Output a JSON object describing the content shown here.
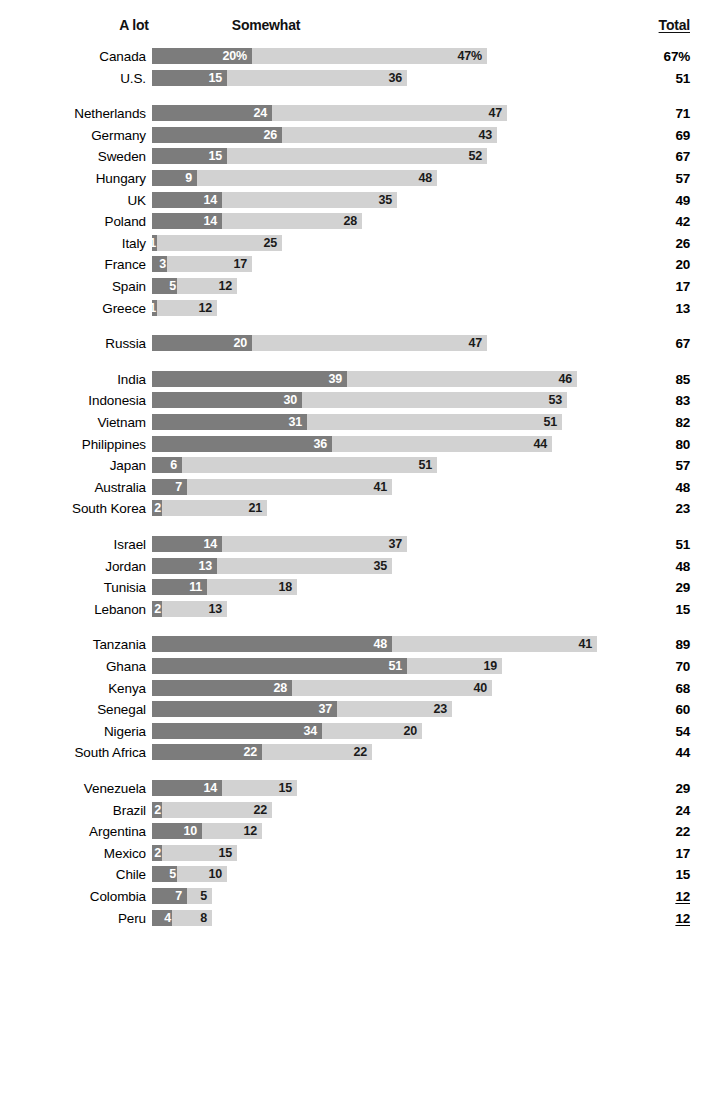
{
  "header": {
    "col_alot": "A lot",
    "col_somewhat": "Somewhat",
    "col_total": "Total"
  },
  "chart_data": {
    "type": "bar",
    "subtype": "stacked-horizontal",
    "title": "",
    "xlabel": "",
    "ylabel": "",
    "legend": [
      "A lot",
      "Somewhat"
    ],
    "legend_position": "top",
    "grid": false,
    "xlim": [
      0,
      100
    ],
    "colors": {
      "a_lot": "#7c7c7c",
      "somewhat": "#d2d2d2"
    },
    "series": [
      {
        "name": "A lot",
        "color": "#7c7c7c"
      },
      {
        "name": "Somewhat",
        "color": "#d2d2d2"
      }
    ],
    "categories": [
      "Canada",
      "U.S.",
      "Netherlands",
      "Germany",
      "Sweden",
      "Hungary",
      "UK",
      "Poland",
      "Italy",
      "France",
      "Spain",
      "Greece",
      "Russia",
      "India",
      "Indonesia",
      "Vietnam",
      "Philippines",
      "Japan",
      "Australia",
      "South Korea",
      "Israel",
      "Jordan",
      "Tunisia",
      "Lebanon",
      "Tanzania",
      "Ghana",
      "Kenya",
      "Senegal",
      "Nigeria",
      "South Africa",
      "Venezuela",
      "Brazil",
      "Argentina",
      "Mexico",
      "Chile",
      "Colombia",
      "Peru"
    ],
    "groups": [
      {
        "rows": [
          {
            "label": "Canada",
            "a_lot": 20,
            "somewhat": 47,
            "total": 67,
            "a_lot_text": "20%",
            "somewhat_text": "47%",
            "total_text": "67%"
          },
          {
            "label": "U.S.",
            "a_lot": 15,
            "somewhat": 36,
            "total": 51,
            "a_lot_text": "15",
            "somewhat_text": "36",
            "total_text": "51"
          }
        ]
      },
      {
        "rows": [
          {
            "label": "Netherlands",
            "a_lot": 24,
            "somewhat": 47,
            "total": 71,
            "a_lot_text": "24",
            "somewhat_text": "47",
            "total_text": "71"
          },
          {
            "label": "Germany",
            "a_lot": 26,
            "somewhat": 43,
            "total": 69,
            "a_lot_text": "26",
            "somewhat_text": "43",
            "total_text": "69"
          },
          {
            "label": "Sweden",
            "a_lot": 15,
            "somewhat": 52,
            "total": 67,
            "a_lot_text": "15",
            "somewhat_text": "52",
            "total_text": "67"
          },
          {
            "label": "Hungary",
            "a_lot": 9,
            "somewhat": 48,
            "total": 57,
            "a_lot_text": "9",
            "somewhat_text": "48",
            "total_text": "57"
          },
          {
            "label": "UK",
            "a_lot": 14,
            "somewhat": 35,
            "total": 49,
            "a_lot_text": "14",
            "somewhat_text": "35",
            "total_text": "49"
          },
          {
            "label": "Poland",
            "a_lot": 14,
            "somewhat": 28,
            "total": 42,
            "a_lot_text": "14",
            "somewhat_text": "28",
            "total_text": "42"
          },
          {
            "label": "Italy",
            "a_lot": 1,
            "somewhat": 25,
            "total": 26,
            "a_lot_text": "1",
            "somewhat_text": "25",
            "total_text": "26"
          },
          {
            "label": "France",
            "a_lot": 3,
            "somewhat": 17,
            "total": 20,
            "a_lot_text": "3",
            "somewhat_text": "17",
            "total_text": "20"
          },
          {
            "label": "Spain",
            "a_lot": 5,
            "somewhat": 12,
            "total": 17,
            "a_lot_text": "5",
            "somewhat_text": "12",
            "total_text": "17"
          },
          {
            "label": "Greece",
            "a_lot": 1,
            "somewhat": 12,
            "total": 13,
            "a_lot_text": "1",
            "somewhat_text": "12",
            "total_text": "13"
          }
        ]
      },
      {
        "rows": [
          {
            "label": "Russia",
            "a_lot": 20,
            "somewhat": 47,
            "total": 67,
            "a_lot_text": "20",
            "somewhat_text": "47",
            "total_text": "67"
          }
        ]
      },
      {
        "rows": [
          {
            "label": "India",
            "a_lot": 39,
            "somewhat": 46,
            "total": 85,
            "a_lot_text": "39",
            "somewhat_text": "46",
            "total_text": "85"
          },
          {
            "label": "Indonesia",
            "a_lot": 30,
            "somewhat": 53,
            "total": 83,
            "a_lot_text": "30",
            "somewhat_text": "53",
            "total_text": "83"
          },
          {
            "label": "Vietnam",
            "a_lot": 31,
            "somewhat": 51,
            "total": 82,
            "a_lot_text": "31",
            "somewhat_text": "51",
            "total_text": "82"
          },
          {
            "label": "Philippines",
            "a_lot": 36,
            "somewhat": 44,
            "total": 80,
            "a_lot_text": "36",
            "somewhat_text": "44",
            "total_text": "80"
          },
          {
            "label": "Japan",
            "a_lot": 6,
            "somewhat": 51,
            "total": 57,
            "a_lot_text": "6",
            "somewhat_text": "51",
            "total_text": "57"
          },
          {
            "label": "Australia",
            "a_lot": 7,
            "somewhat": 41,
            "total": 48,
            "a_lot_text": "7",
            "somewhat_text": "41",
            "total_text": "48"
          },
          {
            "label": "South Korea",
            "a_lot": 2,
            "somewhat": 21,
            "total": 23,
            "a_lot_text": "2",
            "somewhat_text": "21",
            "total_text": "23"
          }
        ]
      },
      {
        "rows": [
          {
            "label": "Israel",
            "a_lot": 14,
            "somewhat": 37,
            "total": 51,
            "a_lot_text": "14",
            "somewhat_text": "37",
            "total_text": "51"
          },
          {
            "label": "Jordan",
            "a_lot": 13,
            "somewhat": 35,
            "total": 48,
            "a_lot_text": "13",
            "somewhat_text": "35",
            "total_text": "48"
          },
          {
            "label": "Tunisia",
            "a_lot": 11,
            "somewhat": 18,
            "total": 29,
            "a_lot_text": "11",
            "somewhat_text": "18",
            "total_text": "29"
          },
          {
            "label": "Lebanon",
            "a_lot": 2,
            "somewhat": 13,
            "total": 15,
            "a_lot_text": "2",
            "somewhat_text": "13",
            "total_text": "15"
          }
        ]
      },
      {
        "rows": [
          {
            "label": "Tanzania",
            "a_lot": 48,
            "somewhat": 41,
            "total": 89,
            "a_lot_text": "48",
            "somewhat_text": "41",
            "total_text": "89"
          },
          {
            "label": "Ghana",
            "a_lot": 51,
            "somewhat": 19,
            "total": 70,
            "a_lot_text": "51",
            "somewhat_text": "19",
            "total_text": "70"
          },
          {
            "label": "Kenya",
            "a_lot": 28,
            "somewhat": 40,
            "total": 68,
            "a_lot_text": "28",
            "somewhat_text": "40",
            "total_text": "68"
          },
          {
            "label": "Senegal",
            "a_lot": 37,
            "somewhat": 23,
            "total": 60,
            "a_lot_text": "37",
            "somewhat_text": "23",
            "total_text": "60"
          },
          {
            "label": "Nigeria",
            "a_lot": 34,
            "somewhat": 20,
            "total": 54,
            "a_lot_text": "34",
            "somewhat_text": "20",
            "total_text": "54"
          },
          {
            "label": "South Africa",
            "a_lot": 22,
            "somewhat": 22,
            "total": 44,
            "a_lot_text": "22",
            "somewhat_text": "22",
            "total_text": "44"
          }
        ]
      },
      {
        "rows": [
          {
            "label": "Venezuela",
            "a_lot": 14,
            "somewhat": 15,
            "total": 29,
            "a_lot_text": "14",
            "somewhat_text": "15",
            "total_text": "29"
          },
          {
            "label": "Brazil",
            "a_lot": 2,
            "somewhat": 22,
            "total": 24,
            "a_lot_text": "2",
            "somewhat_text": "22",
            "total_text": "24"
          },
          {
            "label": "Argentina",
            "a_lot": 10,
            "somewhat": 12,
            "total": 22,
            "a_lot_text": "10",
            "somewhat_text": "12",
            "total_text": "22"
          },
          {
            "label": "Mexico",
            "a_lot": 2,
            "somewhat": 15,
            "total": 17,
            "a_lot_text": "2",
            "somewhat_text": "15",
            "total_text": "17"
          },
          {
            "label": "Chile",
            "a_lot": 5,
            "somewhat": 10,
            "total": 15,
            "a_lot_text": "5",
            "somewhat_text": "10",
            "total_text": "15"
          },
          {
            "label": "Colombia",
            "a_lot": 7,
            "somewhat": 5,
            "total": 12,
            "a_lot_text": "7",
            "somewhat_text": "5",
            "total_text": "12",
            "total_underline": true
          },
          {
            "label": "Peru",
            "a_lot": 4,
            "somewhat": 8,
            "total": 12,
            "a_lot_text": "4",
            "somewhat_text": "8",
            "total_text": "12",
            "total_underline": true
          }
        ]
      }
    ]
  },
  "layout": {
    "bar_origin_x": 152,
    "px_per_unit": 5.0,
    "row_pitch": 21.6,
    "group_gap": 14,
    "first_row_top": 46
  }
}
